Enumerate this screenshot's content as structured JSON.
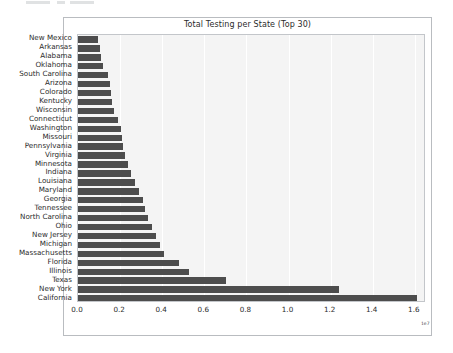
{
  "page": {
    "background_color": "#ffffff",
    "clipped_top_element": "partially-cut-toolbar-strip"
  },
  "figure": {
    "frame_color": "#b9bcc0",
    "plot_background_color": "#f4f4f4",
    "grid_color": "#ffffff",
    "bar_color": "#4d4d4d"
  },
  "chart_data": {
    "type": "bar",
    "orientation": "horizontal",
    "title": "Total Testing per State (Top 30)",
    "xlabel": "",
    "ylabel": "",
    "x_axis_offset_label": "1e7",
    "xlim": [
      0.0,
      1.653
    ],
    "xticks": [
      0.0,
      0.2,
      0.4,
      0.6,
      0.8,
      1.0,
      1.2,
      1.4,
      1.6
    ],
    "xticklabels": [
      "0.0",
      "0.2",
      "0.4",
      "0.6",
      "0.8",
      "1.0",
      "1.2",
      "1.4",
      "1.6"
    ],
    "grid": true,
    "legend": null,
    "categories": [
      "New Mexico",
      "Arkansas",
      "Alabama",
      "Oklahoma",
      "South Carolina",
      "Arizona",
      "Colorado",
      "Kentucky",
      "Wisconsin",
      "Connecticut",
      "Washington",
      "Missouri",
      "Pennsylvania",
      "Virginia",
      "Minnesota",
      "Indiana",
      "Louisiana",
      "Maryland",
      "Georgia",
      "Tennessee",
      "North Carolina",
      "Ohio",
      "New Jersey",
      "Michigan",
      "Massachusetts",
      "Florida",
      "Illinois",
      "Texas",
      "New York",
      "California"
    ],
    "values": [
      0.095,
      0.105,
      0.11,
      0.12,
      0.143,
      0.152,
      0.157,
      0.162,
      0.171,
      0.19,
      0.205,
      0.21,
      0.214,
      0.224,
      0.238,
      0.252,
      0.271,
      0.29,
      0.309,
      0.319,
      0.333,
      0.352,
      0.371,
      0.39,
      0.41,
      0.481,
      0.529,
      0.705,
      1.238,
      1.61
    ],
    "value_units": "1e7 tests"
  }
}
